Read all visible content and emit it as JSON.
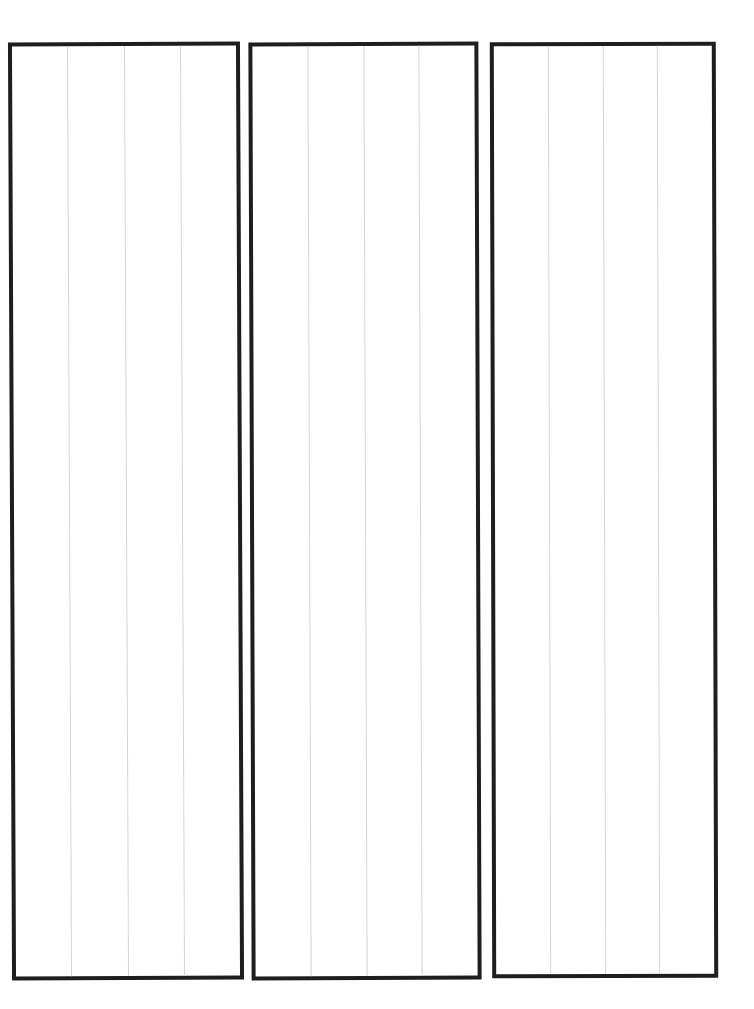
{
  "page": {
    "background": "#ffffff",
    "border_color": "#1e1e1e",
    "column_line_color": "#d6d6d6"
  },
  "panels": [
    {
      "id": "panel-1",
      "columns": 4
    },
    {
      "id": "panel-2",
      "columns": 4
    },
    {
      "id": "panel-3",
      "columns": 4
    }
  ]
}
